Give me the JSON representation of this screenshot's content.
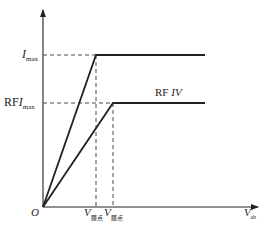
{
  "diagram": {
    "type": "piecewise-linear I-V characteristic",
    "axes": {
      "y_axis": {
        "label": "",
        "arrow": true
      },
      "x_axis": {
        "label_main": "V",
        "label_sub": "ds",
        "arrow": true
      },
      "origin_label": "O"
    },
    "y_levels": [
      {
        "id": "imax",
        "label_prefix": "",
        "label_main": "I",
        "label_sub": "max"
      },
      {
        "id": "rfimax",
        "label_prefix": "RF",
        "label_main": "I",
        "label_sub": "max"
      }
    ],
    "x_marks": [
      {
        "id": "knee1",
        "label_main": "V",
        "label_sub": "膝点"
      },
      {
        "id": "knee2",
        "label_main": "V",
        "label_sub": "膝点"
      }
    ],
    "curves": [
      {
        "id": "dc-curve",
        "description": "rises linearly from origin to knee1 at I_max, then flat"
      },
      {
        "id": "rf-curve",
        "description": "rises linearly from origin to knee2 at RF·I_max, then flat",
        "label_prefix": "RF ",
        "label_italic": "IV"
      }
    ],
    "colors": {
      "line": "#222222",
      "dashed": "#333333",
      "background": "#ffffff"
    }
  }
}
